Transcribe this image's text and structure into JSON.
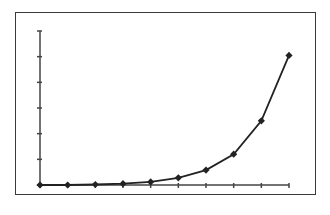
{
  "chart_data": {
    "type": "line",
    "title": "",
    "xlabel": "",
    "ylabel": "",
    "x": [
      1,
      2,
      3,
      4,
      5,
      6,
      7,
      8,
      9,
      10
    ],
    "series": [
      {
        "name": "series-1",
        "values": [
          0,
          0.0,
          0.02,
          0.05,
          0.12,
          0.28,
          0.58,
          1.2,
          2.5,
          5.05
        ]
      }
    ],
    "tick_labels_visible": false,
    "y_ticks": 7,
    "x_ticks": 10,
    "ylim": [
      0,
      6
    ],
    "grid": false,
    "legend": "none",
    "marker": "diamond",
    "colors": {
      "line": "#222222",
      "axis": "#444444",
      "frame": "#3a3a3a"
    }
  }
}
